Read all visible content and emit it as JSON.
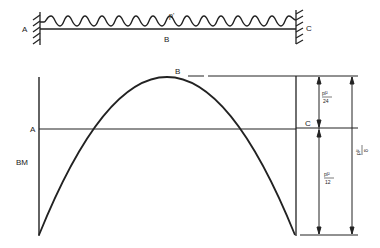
{
  "beam": {
    "support_left_label": "A",
    "support_right_label": "C",
    "midspan_label": "B",
    "load_label": "p'"
  },
  "bm_diagram": {
    "axis_label": "BM",
    "baseline_left_label": "A",
    "baseline_right_label": "C",
    "peak_label": "B",
    "dim_top": {
      "num": "pl²",
      "den": "24"
    },
    "dim_bottom": {
      "num": "pl²",
      "den": "12"
    },
    "dim_total": {
      "num": "pl²",
      "den": "8"
    }
  },
  "colors": {
    "ink": "#222222",
    "background": "#ffffff"
  }
}
